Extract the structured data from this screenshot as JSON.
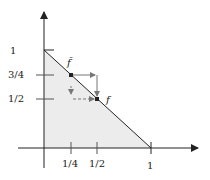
{
  "diagram": {
    "x_ticks": [
      "1/4",
      "1/2",
      "1"
    ],
    "y_ticks": [
      "1",
      "3/4",
      "1/2"
    ],
    "points": {
      "fbar": {
        "label": "f̄",
        "x": 0.25,
        "y": 0.75
      },
      "f": {
        "label": "f",
        "x": 0.5,
        "y": 0.5
      }
    },
    "colors": {
      "region": "#ececec",
      "line": "#222222",
      "arrow": "#777777"
    }
  }
}
